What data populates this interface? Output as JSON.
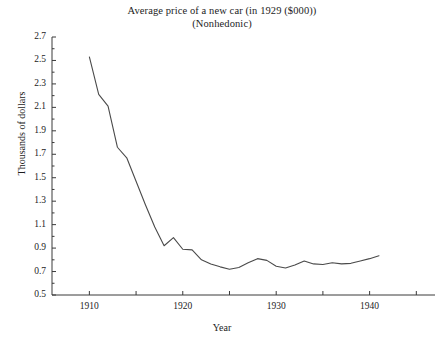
{
  "chart_data": {
    "type": "line",
    "title": "Average price of a new car (in 1929 ($000))",
    "subtitle": "(Nonhedonic)",
    "xlabel": "Year",
    "ylabel": "Thousands of dollars",
    "grid": false,
    "legend": null,
    "xlim": [
      1906,
      1947
    ],
    "ylim": [
      0.5,
      2.7
    ],
    "xticks": [
      1910,
      1915,
      1920,
      1925,
      1930,
      1935,
      1940,
      1945
    ],
    "xtick_labels": [
      "1910",
      "",
      "1920",
      "",
      "1930",
      "",
      "1940",
      ""
    ],
    "yticks": [
      0.5,
      0.7,
      0.9,
      1.1,
      1.3,
      1.5,
      1.7,
      1.9,
      2.1,
      2.3,
      2.5,
      2.7
    ],
    "ytick_labels": [
      "0.5",
      "0.7",
      "0.9",
      "1.1",
      "1.3",
      "1.5",
      "1.7",
      "1.9",
      "2.1",
      "2.3",
      "2.5",
      "2.7"
    ],
    "ytick_minor_step": 0.1,
    "series": [
      {
        "name": "Average price of a new car (nonhedonic)",
        "color": "#4a4a4a",
        "x": [
          1910,
          1911,
          1912,
          1913,
          1914,
          1915,
          1916,
          1917,
          1918,
          1919,
          1920,
          1921,
          1922,
          1923,
          1924,
          1925,
          1926,
          1927,
          1928,
          1929,
          1930,
          1931,
          1932,
          1933,
          1934,
          1935,
          1936,
          1937,
          1938,
          1939,
          1940,
          1941
        ],
        "y": [
          2.53,
          2.21,
          2.11,
          1.76,
          1.67,
          1.47,
          1.27,
          1.08,
          0.92,
          0.99,
          0.89,
          0.885,
          0.8,
          0.765,
          0.74,
          0.72,
          0.735,
          0.775,
          0.81,
          0.795,
          0.745,
          0.73,
          0.755,
          0.79,
          0.765,
          0.76,
          0.775,
          0.765,
          0.77,
          0.79,
          0.81,
          0.835
        ]
      }
    ]
  }
}
